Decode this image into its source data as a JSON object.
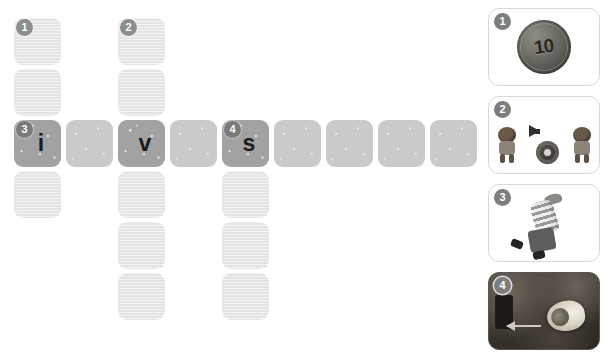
{
  "worksheet": {
    "type": "crossword-puzzle",
    "grid": {
      "columns": 9,
      "rows": 6,
      "cells": [
        {
          "col": 1,
          "row": 1,
          "number": "1",
          "letter": "",
          "state": "empty"
        },
        {
          "col": 1,
          "row": 2,
          "number": "",
          "letter": "",
          "state": "empty"
        },
        {
          "col": 1,
          "row": 3,
          "number": "3",
          "letter": "i",
          "state": "filled"
        },
        {
          "col": 1,
          "row": 4,
          "number": "",
          "letter": "",
          "state": "empty"
        },
        {
          "col": 3,
          "row": 1,
          "number": "2",
          "letter": "",
          "state": "empty"
        },
        {
          "col": 3,
          "row": 2,
          "number": "",
          "letter": "",
          "state": "empty"
        },
        {
          "col": 3,
          "row": 3,
          "number": "",
          "letter": "v",
          "state": "filled"
        },
        {
          "col": 3,
          "row": 4,
          "number": "",
          "letter": "",
          "state": "empty"
        },
        {
          "col": 3,
          "row": 5,
          "number": "",
          "letter": "",
          "state": "empty"
        },
        {
          "col": 3,
          "row": 6,
          "number": "",
          "letter": "",
          "state": "empty"
        },
        {
          "col": 2,
          "row": 3,
          "number": "",
          "letter": "",
          "state": "row"
        },
        {
          "col": 4,
          "row": 3,
          "number": "",
          "letter": "",
          "state": "row"
        },
        {
          "col": 5,
          "row": 3,
          "number": "4",
          "letter": "s",
          "state": "filled"
        },
        {
          "col": 6,
          "row": 3,
          "number": "",
          "letter": "",
          "state": "row"
        },
        {
          "col": 7,
          "row": 3,
          "number": "",
          "letter": "",
          "state": "row"
        },
        {
          "col": 8,
          "row": 3,
          "number": "",
          "letter": "",
          "state": "row"
        },
        {
          "col": 9,
          "row": 3,
          "number": "",
          "letter": "",
          "state": "row"
        },
        {
          "col": 5,
          "row": 4,
          "number": "",
          "letter": "",
          "state": "empty"
        },
        {
          "col": 5,
          "row": 5,
          "number": "",
          "letter": "",
          "state": "empty"
        },
        {
          "col": 5,
          "row": 6,
          "number": "",
          "letter": "",
          "state": "empty"
        }
      ]
    },
    "clues": [
      {
        "number": "1",
        "picture": "coin-ten-cents",
        "value_text": "10",
        "style": "white-card"
      },
      {
        "number": "2",
        "picture": "cavemen-with-wheel",
        "value_text": "",
        "style": "white-card"
      },
      {
        "number": "3",
        "picture": "child-striped-shirt",
        "value_text": "",
        "style": "white-card"
      },
      {
        "number": "4",
        "picture": "shell-on-ground",
        "value_text": "",
        "style": "photo-card"
      }
    ],
    "colors": {
      "cell_empty": "#e4e4e4",
      "cell_row": "#cacaca",
      "cell_filled": "#a2a2a2",
      "badge": "#8d8d8d",
      "letter": "#1b1b1b",
      "card_border": "#d8d8d8",
      "page_background": "#ffffff"
    }
  }
}
